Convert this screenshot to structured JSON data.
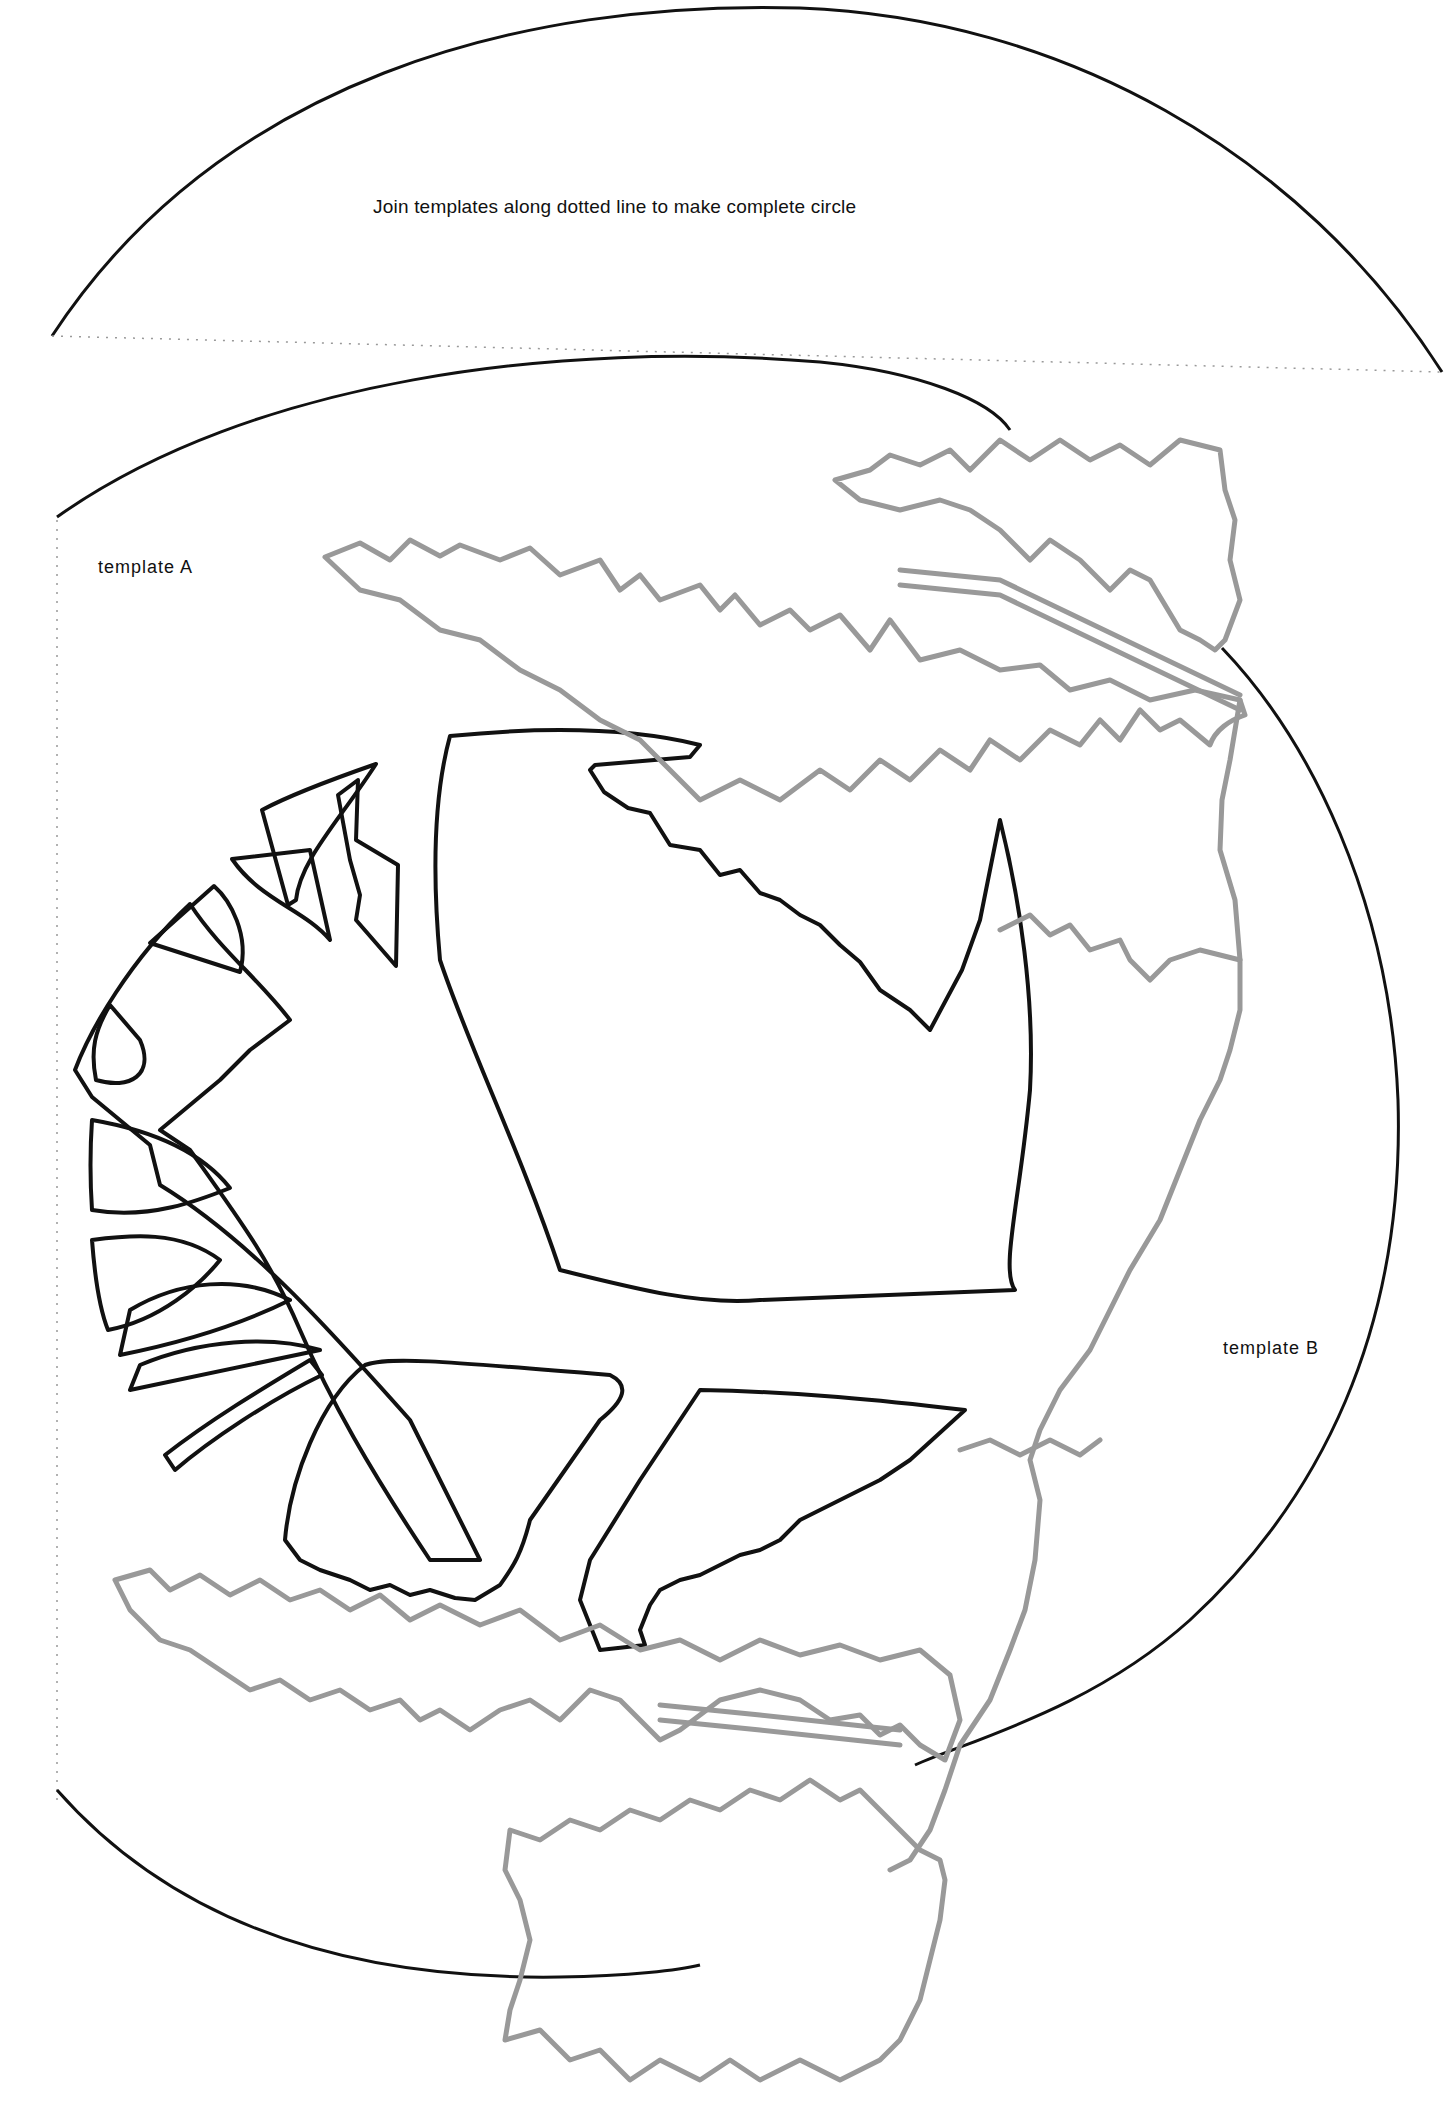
{
  "diagram": {
    "type": "papercraft-template",
    "instruction": "Join templates along dotted line to make complete circle",
    "labels": {
      "template_a": "template A",
      "template_b": "template B"
    },
    "colors": {
      "cut_line": "#111111",
      "fold_outline": "#999999",
      "dotted_join": "#999999",
      "background": "#ffffff"
    },
    "elements": [
      "top arc segment (template B continuation)",
      "dotted join line",
      "main circle outline",
      "stylised tree with branches (black cut lines)",
      "pine tree silhouettes (grey outlines)"
    ]
  }
}
